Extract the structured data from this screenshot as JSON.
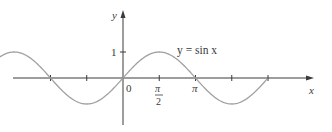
{
  "chart_data": {
    "type": "line",
    "title": "",
    "function_label": "y = sin x",
    "xlabel": "x",
    "ylabel": "y",
    "series": [
      {
        "name": "y = sin x",
        "x_range_radians": [
          -5.7,
          6.26
        ],
        "expression": "sin(x)"
      }
    ],
    "x_ticks": [
      {
        "value": -3.14159,
        "label": ""
      },
      {
        "value": -1.5708,
        "label": ""
      },
      {
        "value": 0,
        "label": "0"
      },
      {
        "value": 1.5708,
        "label": "π/2"
      },
      {
        "value": 3.14159,
        "label": "π"
      },
      {
        "value": 4.71239,
        "label": ""
      },
      {
        "value": 6.28319,
        "label": ""
      }
    ],
    "y_ticks": [
      {
        "value": 1,
        "label": "1"
      }
    ],
    "ylim": [
      -1,
      1
    ],
    "grid": false,
    "legend": "none",
    "annotations": [
      {
        "text": "y = sin x",
        "position": "near peak right of π/2"
      }
    ],
    "colors": {
      "curve": "#a0a0a0",
      "axes": "#3a3a3a"
    }
  },
  "labels": {
    "y_axis": "y",
    "x_axis": "x",
    "origin": "0",
    "one": "1",
    "pi": "π",
    "pi_half_num": "π",
    "pi_half_den": "2",
    "curve_label": "y = sin x"
  }
}
